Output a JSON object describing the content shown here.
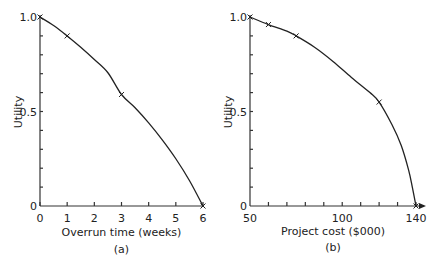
{
  "chart_data": [
    {
      "type": "line",
      "panel": "(a)",
      "title": "",
      "xlabel": "Overrun time (weeks)",
      "ylabel": "Utility",
      "xlim": [
        0,
        6
      ],
      "ylim": [
        0,
        1.0
      ],
      "x_ticks": [
        "0",
        "1",
        "2",
        "3",
        "4",
        "5",
        "6"
      ],
      "y_ticks": [
        "0",
        "0.5",
        "1.0"
      ],
      "grid": false,
      "markers": [
        {
          "x": 0,
          "y": 1.0
        },
        {
          "x": 1,
          "y": 0.9
        },
        {
          "x": 3,
          "y": 0.59
        },
        {
          "x": 6,
          "y": 0
        }
      ],
      "curve": [
        [
          0,
          1.0
        ],
        [
          0.5,
          0.955
        ],
        [
          1,
          0.9
        ],
        [
          1.5,
          0.84
        ],
        [
          2,
          0.775
        ],
        [
          2.5,
          0.705
        ],
        [
          3,
          0.59
        ],
        [
          3.5,
          0.52
        ],
        [
          4,
          0.44
        ],
        [
          4.5,
          0.35
        ],
        [
          5,
          0.25
        ],
        [
          5.5,
          0.135
        ],
        [
          6,
          0
        ]
      ]
    },
    {
      "type": "line",
      "panel": "(b)",
      "title": "",
      "xlabel": "Project cost ($000)",
      "ylabel": "Utility",
      "xlim": [
        50,
        140
      ],
      "ylim": [
        0,
        1.0
      ],
      "x_ticks": [
        "50",
        "100",
        "140"
      ],
      "y_ticks": [
        "0",
        "0.5",
        "1.0"
      ],
      "grid": false,
      "markers": [
        {
          "x": 50,
          "y": 1.0
        },
        {
          "x": 60,
          "y": 0.96
        },
        {
          "x": 75,
          "y": 0.9
        },
        {
          "x": 120,
          "y": 0.55
        },
        {
          "x": 140,
          "y": 0
        }
      ],
      "curve": [
        [
          50,
          1.0
        ],
        [
          60,
          0.96
        ],
        [
          70,
          0.925
        ],
        [
          75,
          0.9
        ],
        [
          85,
          0.84
        ],
        [
          95,
          0.765
        ],
        [
          105,
          0.68
        ],
        [
          115,
          0.6
        ],
        [
          120,
          0.55
        ],
        [
          127,
          0.43
        ],
        [
          132,
          0.32
        ],
        [
          136,
          0.19
        ],
        [
          138,
          0.1
        ],
        [
          140,
          0
        ]
      ]
    }
  ],
  "panels": {
    "a": {
      "xlabel": "Overrun time (weeks)",
      "caption": "(a)",
      "ylabel": "Utility"
    },
    "b": {
      "xlabel": "Project cost ($000)",
      "caption": "(b)",
      "ylabel": "Utility"
    }
  }
}
